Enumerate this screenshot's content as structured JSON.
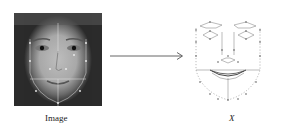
{
  "figure": {
    "left_panel": {
      "label": "Image",
      "content": "face photograph with landmark overlay"
    },
    "arrow": {
      "direction": "right",
      "icon": "arrow-right-icon"
    },
    "right_panel": {
      "label": "X",
      "content": "facial landmark point mesh"
    }
  },
  "colors": {
    "line": "#555555",
    "photo_dark": "#2a2a2a",
    "photo_light": "#bdbdbd"
  }
}
